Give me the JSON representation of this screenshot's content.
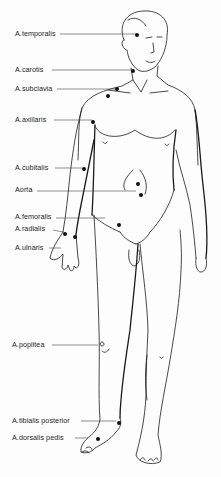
{
  "colors": {
    "line": "#1a1a1a",
    "dot": "#111111",
    "background": "#fdfdfd"
  },
  "labels": [
    {
      "id": "temporalis",
      "text": "A.temporalis",
      "x": 15,
      "y": 30,
      "line": [
        60,
        34,
        137,
        34
      ],
      "dots": [
        [
          137,
          35
        ]
      ]
    },
    {
      "id": "carotis",
      "text": "A.carotis",
      "x": 15,
      "y": 66,
      "line": [
        52,
        70,
        131,
        70
      ],
      "dots": [
        [
          133,
          71
        ]
      ]
    },
    {
      "id": "subclavia",
      "text": "A.subclavia",
      "x": 15,
      "y": 85,
      "line": [
        57,
        89,
        116,
        89
      ],
      "dots": [
        [
          117,
          89
        ],
        [
          108,
          96
        ]
      ]
    },
    {
      "id": "axillaris",
      "text": "A.axillaris",
      "x": 15,
      "y": 116,
      "line": [
        54,
        120,
        92,
        120
      ],
      "dots": [
        [
          93,
          122
        ]
      ]
    },
    {
      "id": "cubitalis",
      "text": "A.cubitalis",
      "x": 15,
      "y": 164,
      "line": [
        55,
        168,
        82,
        168
      ],
      "dots": [
        [
          84,
          169
        ]
      ]
    },
    {
      "id": "aorta",
      "text": "Aorta",
      "x": 15,
      "y": 186,
      "line": [
        37,
        191,
        136,
        191
      ],
      "dots": [
        [
          138,
          184
        ],
        [
          141,
          195
        ]
      ]
    },
    {
      "id": "femoralis",
      "text": "A.femoralis",
      "x": 15,
      "y": 213,
      "line": [
        56,
        218,
        105,
        218
      ],
      "dots": [
        [
          119,
          225
        ]
      ]
    },
    {
      "id": "radialis",
      "text": "A.radialis",
      "x": 15,
      "y": 225,
      "line": [
        53,
        230,
        63,
        232
      ],
      "dots": [
        [
          65,
          234
        ]
      ]
    },
    {
      "id": "ulnaris",
      "text": "A.ulnaris",
      "x": 15,
      "y": 244,
      "line": [
        49,
        248,
        61,
        248
      ],
      "dots": [
        [
          75,
          237
        ]
      ]
    },
    {
      "id": "poplitea",
      "text": "A.poplitea",
      "x": 12,
      "y": 341,
      "line": [
        52,
        345,
        98,
        345
      ],
      "dots": []
    },
    {
      "id": "tibialis",
      "text": "A.tibialis posterior",
      "x": 12,
      "y": 417,
      "line": [
        81,
        421,
        116,
        421
      ],
      "dots": [
        [
          119,
          423
        ]
      ]
    },
    {
      "id": "dorsalis",
      "text": "A.dorsalis  pedis",
      "x": 12,
      "y": 434,
      "line": [
        75,
        438,
        88,
        438
      ],
      "dots": [
        [
          98,
          439
        ]
      ]
    }
  ]
}
